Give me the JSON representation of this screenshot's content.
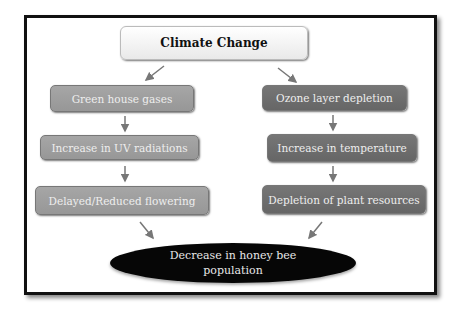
{
  "diagram": {
    "root": "Climate Change",
    "left_branch": [
      "Green house gases",
      "Increase in UV radiations",
      "Delayed/Reduced flowering"
    ],
    "right_branch": [
      "Ozone layer depletion",
      "Increase in temperature",
      "Depletion of plant resources"
    ],
    "outcome": "Decrease in honey bee population",
    "colors": {
      "left_box": "#9e9e9e",
      "right_box": "#6e6e6e",
      "outcome": "#060606",
      "arrow": "#777777"
    }
  }
}
